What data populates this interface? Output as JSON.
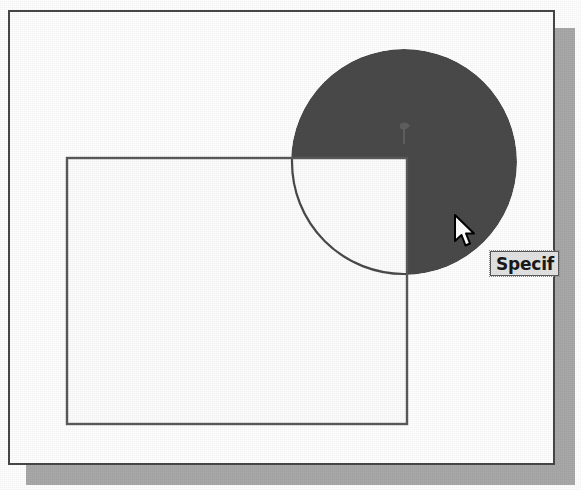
{
  "canvas": {
    "width": 581,
    "height": 490,
    "background_color": "#ffffff"
  },
  "frame": {
    "name": "drawing-frame",
    "x": 8,
    "y": 10,
    "width": 547,
    "height": 455,
    "border_color": "#474747",
    "fill_color": "#ffffff",
    "shadow_color": "#a9a9a9",
    "shadow_offset": 18
  },
  "shapes": {
    "rectangle": {
      "label": "rectangle",
      "x": 67,
      "y": 158,
      "width": 340,
      "height": 266,
      "stroke_color": "#5a5a5a",
      "stroke_width": 2,
      "fill_color": "#fdfdfd"
    },
    "circle": {
      "label": "circle",
      "center_x": 404,
      "center_y": 162,
      "radius": 113,
      "fill_color": "#4a4a4a",
      "stroke_color": "#3c3c3c",
      "trimmed_quadrant": "lower-left",
      "trimmed_fill_color": "#fdfdfd",
      "arc_stroke_color": "#4a4a4a"
    }
  },
  "cursor": {
    "label": "arrow-pointer",
    "x": 452,
    "y": 213,
    "fill_color": "#ffffff",
    "outline_color": "#000000"
  },
  "tooltip": {
    "label": "command-prompt-tooltip",
    "text": "Specif",
    "x": 490,
    "y": 251,
    "background_color": "#e4e4e4",
    "border_color": "#5a5a5a",
    "text_color": "#1a1a1a",
    "clipped": true
  }
}
